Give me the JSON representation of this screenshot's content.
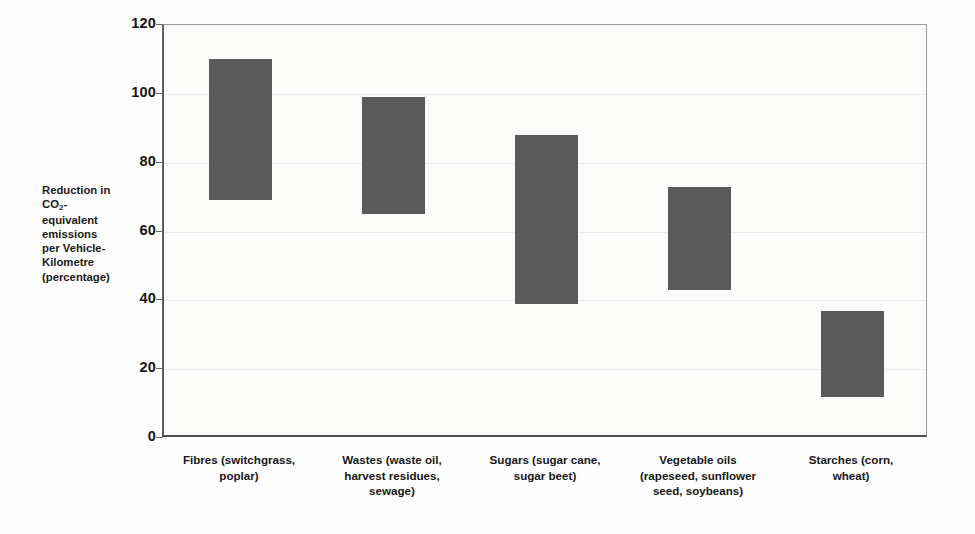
{
  "chart_data": {
    "type": "bar",
    "bar_style": "floating-range",
    "title": "",
    "subtitle": "",
    "xlabel": "",
    "ylabel": "Reduction in CO2-equivalent emissions per Vehicle-Kilometre (percentage)",
    "ylabel_lines": [
      "Reduction in",
      "CO₂-",
      "equivalent",
      "emissions",
      "per Vehicle-",
      "Kilometre",
      "(percentage)"
    ],
    "ylim": [
      0,
      120
    ],
    "ytick_values": [
      0,
      20,
      40,
      60,
      80,
      100,
      120
    ],
    "ytick_labels": [
      "0",
      "20",
      "40",
      "60",
      "80",
      "100",
      "120"
    ],
    "grid": true,
    "legend": "none",
    "categories": [
      "Fibres (switchgrass, poplar)",
      "Wastes (waste oil, harvest residues, sewage)",
      "Sugars (sugar cane, sugar beet)",
      "Vegetable oils (rapeseed, sunflower seed, soybeans)",
      "Starches (corn, wheat)"
    ],
    "category_label_lines": [
      [
        "Fibres (switchgrass,",
        "poplar)"
      ],
      [
        "Wastes (waste oil,",
        "harvest residues,",
        "sewage)"
      ],
      [
        "Sugars (sugar cane,",
        "sugar beet)"
      ],
      [
        "Vegetable oils",
        "(rapeseed, sunflower",
        "seed, soybeans)"
      ],
      [
        "Starches (corn,",
        "wheat)"
      ]
    ],
    "ranges": [
      {
        "category": "Fibres (switchgrass, poplar)",
        "low": 69,
        "high": 110
      },
      {
        "category": "Wastes (waste oil, harvest residues, sewage)",
        "low": 65,
        "high": 99
      },
      {
        "category": "Sugars (sugar cane, sugar beet)",
        "low": 39,
        "high": 88
      },
      {
        "category": "Vegetable oils (rapeseed, sunflower seed, soybeans)",
        "low": 43,
        "high": 73
      },
      {
        "category": "Starches (corn, wheat)",
        "low": 12,
        "high": 37
      }
    ],
    "low_values": [
      69,
      65,
      39,
      43,
      12
    ],
    "high_values": [
      110,
      99,
      88,
      73,
      37
    ],
    "colors": {
      "bar_fill": "#5a5a5a",
      "plot_background": "#fbfbfa",
      "axis_line": "#4e4e4e",
      "gridline": "#ececec",
      "text": "#141414"
    }
  }
}
